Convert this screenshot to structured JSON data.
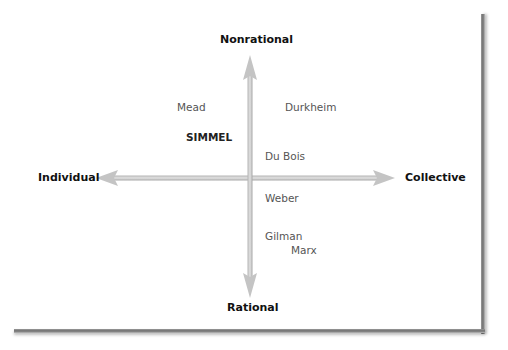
{
  "diagram": {
    "type": "quadrant",
    "axes": {
      "top": "Nonrational",
      "bottom": "Rational",
      "left": "Individual",
      "right": "Collective"
    },
    "theorists": [
      {
        "name": "Mead",
        "quadrant": "individual-nonrational",
        "emphasis": false
      },
      {
        "name": "SIMMEL",
        "quadrant": "individual-nonrational",
        "emphasis": true
      },
      {
        "name": "Durkheim",
        "quadrant": "collective-nonrational",
        "emphasis": false
      },
      {
        "name": "Du Bois",
        "quadrant": "collective-nonrational",
        "emphasis": false
      },
      {
        "name": "Weber",
        "quadrant": "collective-rational",
        "emphasis": false
      },
      {
        "name": "Gilman",
        "quadrant": "collective-rational",
        "emphasis": false
      },
      {
        "name": "Marx",
        "quadrant": "collective-rational",
        "emphasis": false
      }
    ],
    "colors": {
      "arrow": "#c8c8c8",
      "axis_label": "#111111",
      "name_label": "#555555",
      "frame_shadow": "#7a7a7a"
    }
  }
}
